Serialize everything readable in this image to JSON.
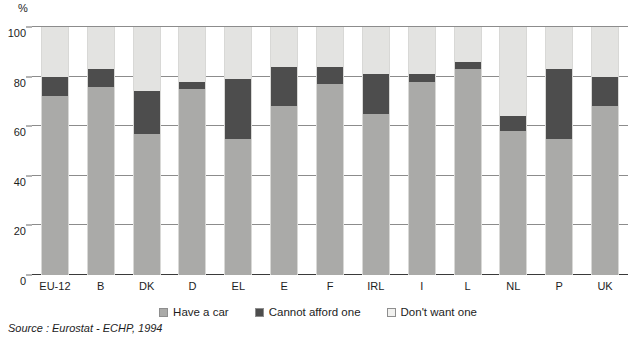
{
  "axis": {
    "unit_label": "%",
    "y_ticks": [
      0,
      20,
      40,
      60,
      80,
      100
    ]
  },
  "legend": {
    "items": [
      {
        "label": "Have a car",
        "key": "have",
        "color": "#aaaaa8",
        "icon": "legend-swatch"
      },
      {
        "label": "Cannot afford one",
        "key": "cannot",
        "color": "#4d4d4d",
        "icon": "legend-swatch"
      },
      {
        "label": "Don't want one",
        "key": "dont",
        "color": "#f1f1ef",
        "icon": "legend-swatch"
      }
    ]
  },
  "source": "Source : Eurostat - ECHP, 1994",
  "chart_data": {
    "type": "bar",
    "subtype": "stacked-column",
    "title": "",
    "subtitle": "",
    "xlabel": "",
    "ylabel": "%",
    "ylim": [
      0,
      100
    ],
    "yticks": [
      0,
      20,
      40,
      60,
      80,
      100
    ],
    "grid": true,
    "legend_position": "bottom-center",
    "categories": [
      "EU-12",
      "B",
      "DK",
      "D",
      "EL",
      "E",
      "F",
      "IRL",
      "I",
      "L",
      "NL",
      "P",
      "UK"
    ],
    "series": [
      {
        "name": "Have a car",
        "color": "#aaaaa8",
        "values": [
          72,
          76,
          57,
          75,
          55,
          68,
          77,
          65,
          78,
          83,
          58,
          55,
          68
        ]
      },
      {
        "name": "Cannot afford one",
        "color": "#4d4d4d",
        "values": [
          8,
          7,
          17,
          3,
          24,
          16,
          7,
          16,
          3,
          3,
          6,
          28,
          12
        ]
      },
      {
        "name": "Don't want one",
        "color": "#e3e3e1",
        "values": [
          20,
          17,
          26,
          22,
          21,
          16,
          16,
          19,
          19,
          14,
          36,
          17,
          20
        ]
      }
    ],
    "cumulative_tops": {
      "have_a_car": [
        72,
        76,
        57,
        75,
        55,
        68,
        77,
        65,
        78,
        83,
        58,
        55,
        68
      ],
      "plus_cannot_afford": [
        80,
        83,
        74,
        78,
        79,
        84,
        84,
        81,
        81,
        86,
        64,
        83,
        80
      ],
      "total": [
        100,
        100,
        100,
        100,
        100,
        100,
        100,
        100,
        100,
        100,
        100,
        100,
        100
      ]
    }
  }
}
